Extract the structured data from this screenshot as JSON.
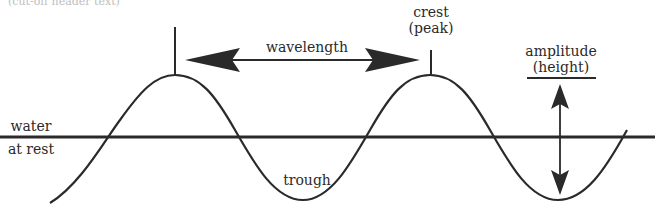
{
  "diagram": {
    "title_fragment": "(cut-off header text)",
    "labels": {
      "wavelength": "wavelength",
      "crest_line1": "crest",
      "crest_line2": "(peak)",
      "amplitude_line1": "amplitude",
      "amplitude_line2": "(height)",
      "water_line1": "water",
      "water_line2": "at rest",
      "trough": "trough"
    },
    "icons": {
      "wavelength_arrow": "double-headed-horizontal-arrow",
      "amplitude_arrow": "double-headed-vertical-arrow"
    },
    "colors": {
      "ink": "#2a2a2a",
      "background": "#ffffff"
    }
  }
}
